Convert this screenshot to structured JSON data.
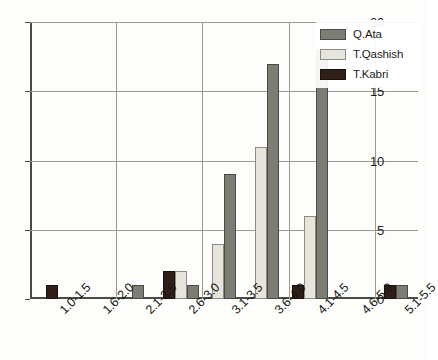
{
  "chart_data": {
    "type": "bar",
    "title": "",
    "xlabel": "",
    "ylabel": "",
    "ylim": [
      0,
      20
    ],
    "yticks": [
      0,
      5,
      10,
      15,
      20
    ],
    "grid": true,
    "legend_position": "top-right",
    "categories": [
      "1.0-1.5",
      "1.6-2.0",
      "2.1-2.5",
      "2.6-3.0",
      "3.1-3.5",
      "3.6-4.0",
      "4.1-4.5",
      "4.6-5.0",
      "5.1-5.5"
    ],
    "series": [
      {
        "name": "T.Kabri",
        "color": "#2e1f18",
        "values": [
          1,
          0,
          0,
          2,
          0,
          0,
          1,
          0,
          1
        ]
      },
      {
        "name": "T.Qashish",
        "color": "#e7e5db",
        "values": [
          0,
          0,
          0,
          2,
          4,
          11,
          6,
          0,
          0
        ]
      },
      {
        "name": "Q.Ata",
        "color": "#7d7d76",
        "values": [
          0,
          0,
          1,
          1,
          9,
          17,
          18,
          0,
          1
        ]
      }
    ],
    "legend_order": [
      "Q.Ata",
      "T.Qashish",
      "T.Kabri"
    ]
  }
}
